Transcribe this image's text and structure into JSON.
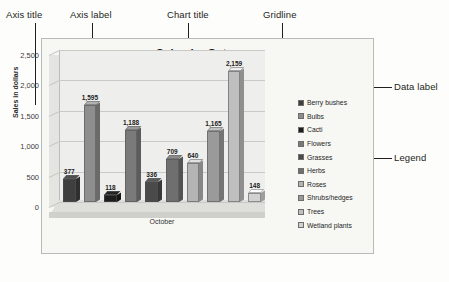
{
  "callouts": [
    {
      "label": "Axis title"
    },
    {
      "label": "Axis label"
    },
    {
      "label": "Chart title"
    },
    {
      "label": "Gridline"
    },
    {
      "label": "Data label"
    },
    {
      "label": "Legend"
    }
  ],
  "chart_data": {
    "type": "bar",
    "title": "Sales by Category",
    "xlabel": "October",
    "ylabel": "Sales in dollars",
    "ylim": [
      0,
      2500
    ],
    "yticks": [
      "0",
      "500",
      "1,000",
      "1,500",
      "2,000",
      "2,500"
    ],
    "grid": true,
    "legend_position": "right",
    "categories": [
      "Berry bushes",
      "Bulbs",
      "Cacti",
      "Flowers",
      "Grasses",
      "Herbs",
      "Roses",
      "Shrubs/hedges",
      "Trees",
      "Wetland plants"
    ],
    "values": [
      377,
      1595,
      118,
      1188,
      336,
      709,
      640,
      1165,
      2159,
      148
    ],
    "value_labels": [
      "377",
      "1,595",
      "118",
      "1,188",
      "336",
      "709",
      "640",
      "1,165",
      "2,159",
      "148"
    ],
    "colors": [
      "#3f3f3f",
      "#8e8e8e",
      "#1d1d1d",
      "#7a7a7a",
      "#4a4a4a",
      "#6f6f6f",
      "#b4b4b4",
      "#9a9a9a",
      "#bfbfbf",
      "#d2d2d2"
    ]
  }
}
